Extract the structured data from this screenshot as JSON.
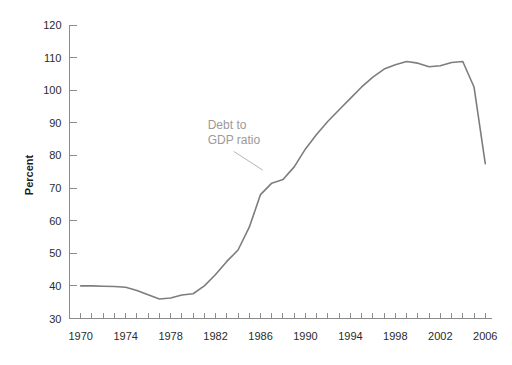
{
  "chart_data": {
    "type": "line",
    "title": "",
    "xlabel": "",
    "ylabel": "Percent",
    "xlim": [
      1969,
      2006.6
    ],
    "ylim": [
      30,
      120
    ],
    "grid": false,
    "legend_position": "none",
    "annotations": [
      {
        "text_line1": "Debt to",
        "text_line2": "GDP ratio",
        "anchor_x": 1986.2,
        "anchor_y": 75.5,
        "label_x": 1981.3,
        "label_y": 88.0
      }
    ],
    "y_ticks": [
      30,
      40,
      50,
      60,
      70,
      80,
      90,
      100,
      110,
      120
    ],
    "x_ticks_labeled": [
      1970,
      1974,
      1978,
      1982,
      1986,
      1990,
      1994,
      1998,
      2002,
      2006
    ],
    "x_ticks_minor_step": 1,
    "series": [
      {
        "name": "Debt to GDP ratio",
        "color": "#7d7d7d",
        "x": [
          1970,
          1971,
          1972,
          1973,
          1974,
          1975,
          1976,
          1977,
          1978,
          1979,
          1980,
          1981,
          1982,
          1983,
          1984,
          1985,
          1986,
          1987,
          1988,
          1989,
          1990,
          1991,
          1992,
          1993,
          1994,
          1995,
          1996,
          1997,
          1998,
          1999,
          2000,
          2001,
          2002,
          2003,
          2004,
          2005,
          2006
        ],
        "values": [
          40.0,
          40.0,
          39.9,
          39.8,
          39.6,
          38.6,
          37.3,
          36.0,
          36.3,
          37.2,
          37.6,
          40.0,
          43.5,
          47.5,
          51.0,
          58.0,
          68.0,
          71.5,
          72.6,
          76.5,
          82.0,
          86.5,
          90.5,
          94.0,
          97.5,
          101.0,
          104.0,
          106.5,
          107.8,
          108.8,
          108.3,
          107.2,
          107.5,
          108.5,
          108.8,
          101.0,
          77.5
        ]
      }
    ]
  },
  "axis": {
    "y_title": "Percent"
  }
}
